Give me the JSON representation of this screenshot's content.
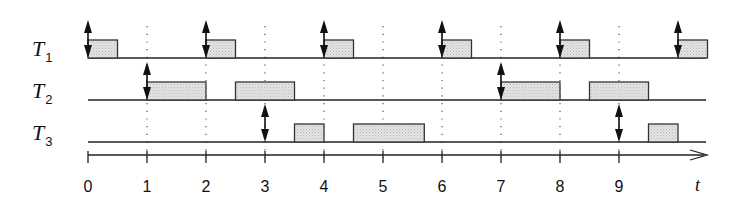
{
  "diagram": {
    "title": "",
    "type": "schedule-timeline",
    "axis": {
      "label": "t",
      "ticks": [
        "0",
        "1",
        "2",
        "3",
        "4",
        "5",
        "6",
        "7",
        "8",
        "9"
      ],
      "tick_values": [
        0,
        1,
        2,
        3,
        4,
        5,
        6,
        7,
        8,
        9
      ],
      "range": [
        0,
        10.5
      ]
    },
    "tasks": [
      {
        "name": "T",
        "sub": "1",
        "releases": [
          0,
          2,
          4,
          6,
          8,
          10
        ],
        "executions": [
          [
            0,
            0.5
          ],
          [
            2,
            2.5
          ],
          [
            4,
            4.5
          ],
          [
            6,
            6.5
          ],
          [
            8,
            8.5
          ],
          [
            10,
            10.5
          ]
        ]
      },
      {
        "name": "T",
        "sub": "2",
        "releases": [
          1,
          7
        ],
        "executions": [
          [
            1,
            2
          ],
          [
            2.5,
            3.5
          ],
          [
            7,
            8
          ],
          [
            8.5,
            9.5
          ]
        ]
      },
      {
        "name": "T",
        "sub": "3",
        "releases": [
          3,
          9
        ],
        "executions": [
          [
            3.5,
            4
          ],
          [
            4.5,
            5.7
          ],
          [
            9.5,
            10
          ]
        ]
      }
    ],
    "dotted_guides": [
      1,
      2,
      3,
      4,
      5,
      6,
      7,
      8,
      9
    ],
    "colors": {
      "line": "#222222",
      "box_fill": "#dcdcdc",
      "box_stroke": "#333333",
      "guide": "#555555"
    }
  }
}
